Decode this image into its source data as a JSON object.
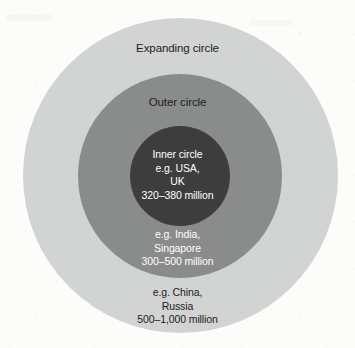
{
  "diagram": {
    "type": "concentric-circles",
    "title_visible": false,
    "colors": {
      "expanding_circle_fill": "#d2d3d3",
      "outer_circle_fill": "#8a8b8b",
      "inner_circle_fill": "#3d3d3d",
      "dark_text": "#1d1d1d",
      "light_text": "#ffffff",
      "background": "#fcfcfb"
    },
    "rings": [
      {
        "id": "expanding-circle",
        "name": "Expanding circle",
        "heading": "Expanding circle",
        "heading_color": "#1d1d1d",
        "fill": "#d2d3d3",
        "examples_line_1": "e.g. China,",
        "examples_line_2": "Russia",
        "speakers": "500–1,000 million",
        "speaker_min_millions": 500,
        "speaker_max_millions": 1000,
        "examples": [
          "China",
          "Russia"
        ]
      },
      {
        "id": "outer-circle",
        "name": "Outer circle",
        "heading": "Outer circle",
        "heading_color": "#1d1d1d",
        "fill": "#8a8b8b",
        "examples_line_1": "e.g. India,",
        "examples_line_2": "Singapore",
        "speakers": "300–500 million",
        "speaker_min_millions": 300,
        "speaker_max_millions": 500,
        "examples": [
          "India",
          "Singapore"
        ]
      },
      {
        "id": "inner-circle",
        "name": "Inner circle",
        "heading": "Inner circle",
        "heading_color": "#ffffff",
        "fill": "#3d3d3d",
        "examples_line_1": "e.g. USA,",
        "examples_line_2": "UK",
        "speakers": "320–380 million",
        "speaker_min_millions": 320,
        "speaker_max_millions": 380,
        "examples": [
          "USA",
          "UK"
        ]
      }
    ]
  }
}
